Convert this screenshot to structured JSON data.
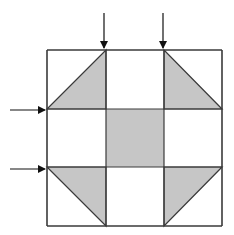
{
  "diagram": {
    "type": "quilt-block-3x3",
    "colors": {
      "stroke": "#3a3a3a",
      "fill": "#c6c6c6",
      "background": "#ffffff",
      "arrow": "#111111"
    },
    "grid": {
      "x": [
        47,
        106,
        164,
        222
      ],
      "y": [
        50,
        109,
        167,
        226
      ]
    },
    "shaded_center": {
      "x": 106,
      "y": 109,
      "w": 58,
      "h": 58
    },
    "shaded_triangles": [
      {
        "name": "top-left",
        "points": "47,109 106,50 106,109"
      },
      {
        "name": "top-right",
        "points": "164,50 164,109 222,109"
      },
      {
        "name": "bottom-left",
        "points": "47,167 106,167 106,226"
      },
      {
        "name": "bottom-right",
        "points": "164,167 222,167 164,226"
      }
    ],
    "arrows": [
      {
        "name": "arrow-top-1",
        "x1": 104,
        "y1": 13,
        "x2": 104,
        "y2": 48
      },
      {
        "name": "arrow-top-2",
        "x1": 163,
        "y1": 13,
        "x2": 163,
        "y2": 48
      },
      {
        "name": "arrow-left-1",
        "x1": 10,
        "y1": 110,
        "x2": 45,
        "y2": 110
      },
      {
        "name": "arrow-left-2",
        "x1": 10,
        "y1": 169,
        "x2": 45,
        "y2": 169
      }
    ]
  }
}
